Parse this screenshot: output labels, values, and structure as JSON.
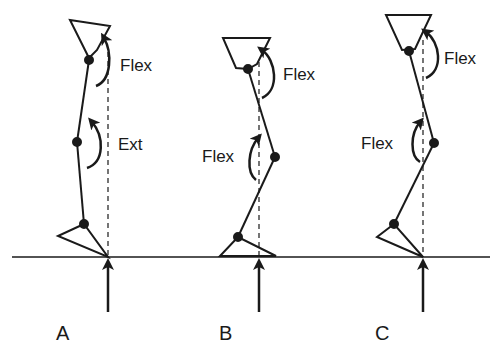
{
  "figure": {
    "ground_line": {
      "y": 257,
      "x1": 12,
      "x2": 490
    },
    "colors": {
      "line": "#1a1a1a",
      "background": "#ffffff"
    },
    "panels": [
      {
        "id": "A",
        "label": "A",
        "hip_moment_label": "Flex",
        "knee_moment_label": "Ext",
        "force_x": 108
      },
      {
        "id": "B",
        "label": "B",
        "hip_moment_label": "Flex",
        "knee_moment_label": "Flex",
        "force_x": 259
      },
      {
        "id": "C",
        "label": "C",
        "hip_moment_label": "Flex",
        "knee_moment_label": "Flex",
        "force_x": 423
      }
    ]
  }
}
